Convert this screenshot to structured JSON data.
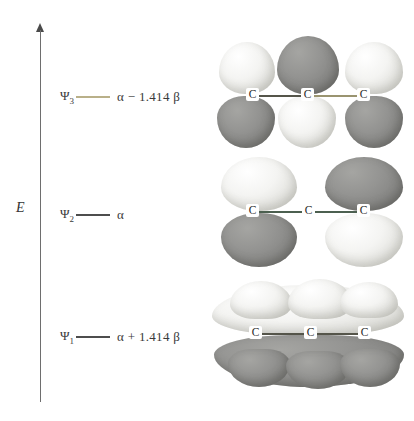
{
  "figure": {
    "axis": {
      "label": "E",
      "label_name": "energy-axis-label",
      "direction": "up"
    },
    "colors": {
      "lobe_light": "#f2f2f0",
      "lobe_dark": "#8a8a88",
      "level_line_dark": "#4d4d4d",
      "level_line_tan": "#b9b089",
      "bond_dark": "#55554a",
      "bond_green": "#4c6050",
      "axis": "#6e6e6e"
    },
    "atom_label": "C",
    "levels": [
      {
        "id": "psi3",
        "psi": "Ψ",
        "psi_sub": "3",
        "value": "α − 1.414 β",
        "rule_color": "tan",
        "character": "antibonding",
        "nodes": 2
      },
      {
        "id": "psi2",
        "psi": "Ψ",
        "psi_sub": "2",
        "value": "α",
        "rule_color": "dark",
        "character": "nonbonding",
        "nodes": 1
      },
      {
        "id": "psi1",
        "psi": "Ψ",
        "psi_sub": "1",
        "value": "α + 1.414 β",
        "rule_color": "dark",
        "character": "bonding",
        "nodes": 0
      }
    ],
    "orbitals": [
      {
        "id": "psi3",
        "atoms": [
          "C",
          "C",
          "C"
        ],
        "top_phases": [
          "light",
          "dark",
          "light"
        ],
        "bottom_phases": [
          "dark",
          "light",
          "dark"
        ]
      },
      {
        "id": "psi2",
        "atoms": [
          "C",
          "C",
          "C"
        ],
        "top_phases": [
          "light",
          "none",
          "dark"
        ],
        "bottom_phases": [
          "dark",
          "none",
          "light"
        ]
      },
      {
        "id": "psi1",
        "atoms": [
          "C",
          "C",
          "C"
        ],
        "top_phases": [
          "light",
          "light",
          "light"
        ],
        "bottom_phases": [
          "dark",
          "dark",
          "dark"
        ]
      }
    ]
  }
}
